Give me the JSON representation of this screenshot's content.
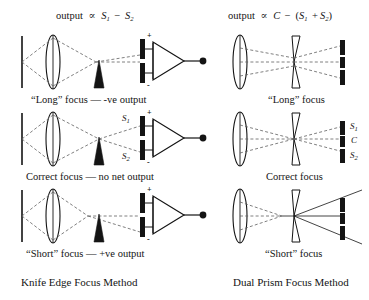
{
  "figure": {
    "background": "#ffffff",
    "ink": "#141414",
    "width": 369,
    "height": 300
  },
  "columns": {
    "left": {
      "header_prefix": "output",
      "header_prop": "∝",
      "header_expr_a": "S",
      "header_sub_a": "1",
      "header_minus": "−",
      "header_expr_b": "S",
      "header_sub_b": "2",
      "header_full": "output ∝ S₁ − S₂",
      "title": "Knife Edge Focus Method",
      "rows": [
        {
          "caption": "“Long” focus  —  -ve output",
          "state": "long-focus",
          "plus_label": "+",
          "minus_label": "-"
        },
        {
          "caption": "Correct focus  —  no net output",
          "state": "correct-focus",
          "plus_label": "+",
          "minus_label": "-",
          "detector_labels": [
            {
              "text": "S",
              "sub": "1"
            },
            {
              "text": "S",
              "sub": "2"
            }
          ]
        },
        {
          "caption": "“Short” focus  —  +ve output",
          "state": "short-focus",
          "plus_label": "+",
          "minus_label": "-"
        }
      ]
    },
    "right": {
      "header_full": "output ∝  C − (S₁ + S₂)",
      "header_prefix": "output",
      "header_prop": "∝",
      "header_c": "C",
      "header_minus": "−",
      "header_open": "(",
      "header_s1": "S",
      "header_s1_sub": "1",
      "header_plus": "+",
      "header_s2": "S",
      "header_s2_sub": "2",
      "header_close": ")",
      "title": "Dual Prism Focus Method",
      "rows": [
        {
          "caption": "“Long” focus",
          "state": "long-focus"
        },
        {
          "caption": "Correct focus",
          "state": "correct-focus",
          "detector_labels": [
            {
              "text": "S",
              "sub": "1"
            },
            {
              "text": "C",
              "sub": ""
            },
            {
              "text": "S",
              "sub": "2"
            }
          ]
        },
        {
          "caption": "“Short” focus",
          "state": "short-focus"
        }
      ]
    }
  },
  "components": {
    "source_line": "source-aperture-line",
    "lens": "converging-lens",
    "knife_edge": "knife-edge-prism",
    "detector_bar": "photodetector-bar",
    "opamp": "differential-amplifier",
    "output_node": "output-terminal",
    "dual_prism": "dual-prism",
    "ray": "light-ray"
  }
}
